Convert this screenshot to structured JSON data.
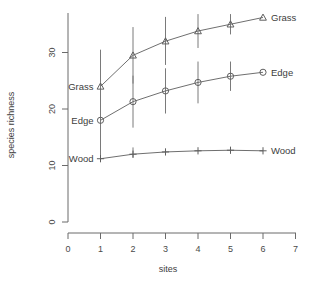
{
  "chart_data": {
    "type": "line",
    "title": "",
    "xlabel": "sites",
    "ylabel": "species richness",
    "x": [
      1,
      2,
      3,
      4,
      5,
      6
    ],
    "xlim": [
      0,
      7
    ],
    "ylim": [
      0,
      38
    ],
    "xticks": [
      0,
      1,
      2,
      3,
      4,
      5,
      6,
      7
    ],
    "yticks": [
      0,
      10,
      20,
      30
    ],
    "xticklabels": [
      "0",
      "1",
      "2",
      "3",
      "4",
      "5",
      "6",
      "7"
    ],
    "yticklabels": [
      "0",
      "10",
      "20",
      "30"
    ],
    "grid": false,
    "legend_position": "inline-endpoints",
    "series": [
      {
        "name": "Grass",
        "marker": "triangle",
        "values": [
          24.0,
          29.5,
          32.0,
          33.8,
          35.0,
          36.2
        ],
        "err_low": [
          7.0,
          5.0,
          4.2,
          3.0,
          1.8,
          0.0
        ],
        "err_high": [
          6.5,
          5.0,
          4.3,
          3.0,
          1.8,
          0.0
        ],
        "left_label": "Grass",
        "right_label": "Grass"
      },
      {
        "name": "Edge",
        "marker": "circle",
        "values": [
          18.0,
          21.3,
          23.2,
          24.7,
          25.8,
          26.5
        ],
        "err_low": [
          6.8,
          4.6,
          4.0,
          3.7,
          2.6,
          0.0
        ],
        "err_high": [
          6.5,
          4.6,
          4.0,
          3.7,
          2.6,
          0.0
        ],
        "left_label": "Edge",
        "right_label": "Edge"
      },
      {
        "name": "Wood",
        "marker": "plus",
        "values": [
          11.2,
          12.0,
          12.4,
          12.6,
          12.7,
          12.6
        ],
        "err_low": [
          0.0,
          0.6,
          0.0,
          0.0,
          0.0,
          0.0
        ],
        "err_high": [
          0.0,
          1.2,
          0.0,
          0.0,
          0.0,
          0.0
        ],
        "left_label": "Wood",
        "right_label": "Wood"
      }
    ],
    "colors": {
      "axis": "#6b6b6b",
      "line": "#6f6f6f",
      "marker": "#5f5f5f",
      "errorbar": "#7a7a7a",
      "text": "#3d3d3d",
      "background": "#ffffff"
    }
  }
}
